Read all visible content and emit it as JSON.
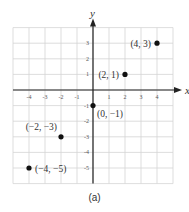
{
  "chart_data": {
    "type": "scatter",
    "title": "",
    "caption": "(a)",
    "xlabel": "x",
    "ylabel": "y",
    "xlim": [
      -5,
      5
    ],
    "ylim": [
      -6,
      4
    ],
    "grid": true,
    "x_ticks": [
      -4,
      -3,
      -2,
      -1,
      1,
      2,
      3,
      4
    ],
    "y_ticks": [
      3,
      2,
      1,
      -1,
      -2,
      -3,
      -4,
      -5
    ],
    "x_tick_labels": [
      "-4",
      "-3",
      "-2",
      "-1",
      "1",
      "2",
      "3",
      "4"
    ],
    "y_tick_labels": [
      "3",
      "2",
      "1",
      "-1",
      "-2",
      "-3",
      "-4",
      "-5"
    ],
    "points": [
      {
        "x": 4,
        "y": 3,
        "label": "(4, 3)",
        "label_pos": "left"
      },
      {
        "x": 2,
        "y": 1,
        "label": "(2, 1)",
        "label_pos": "left"
      },
      {
        "x": 0,
        "y": -1,
        "label": "(0, −1)",
        "label_pos": "below-right"
      },
      {
        "x": -2,
        "y": -3,
        "label": "(−2, −3)",
        "label_pos": "above-left"
      },
      {
        "x": -4,
        "y": -5,
        "label": "(−4, −5)",
        "label_pos": "right"
      }
    ],
    "colors": {
      "grid": "#d4d4d4",
      "axis": "#222222",
      "point": "#111111",
      "text": "#333333"
    }
  }
}
